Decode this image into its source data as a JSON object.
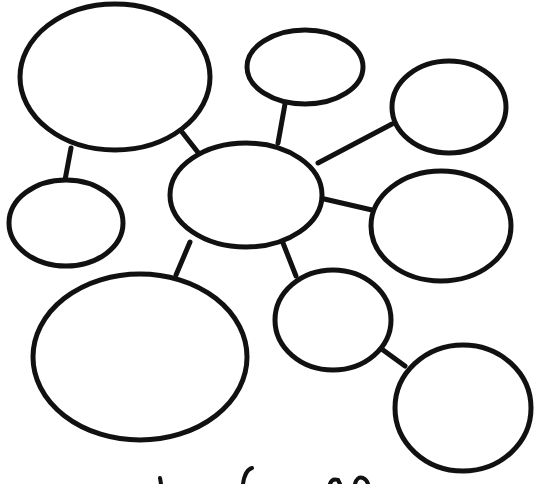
{
  "diagram": {
    "type": "bubble-map",
    "title": "",
    "colors": {
      "stroke": "#111111",
      "background": "#ffffff"
    },
    "center": {
      "id": "center",
      "label": "",
      "cx": 246,
      "cy": 195,
      "rx": 76,
      "ry": 52
    },
    "nodes": [
      {
        "id": "top-left-large",
        "label": "",
        "cx": 115,
        "cy": 77,
        "rx": 95,
        "ry": 73
      },
      {
        "id": "left-small",
        "label": "",
        "cx": 66,
        "cy": 223,
        "rx": 57,
        "ry": 43
      },
      {
        "id": "top-center",
        "label": "",
        "cx": 305,
        "cy": 67,
        "rx": 58,
        "ry": 37
      },
      {
        "id": "right-upper",
        "label": "",
        "cx": 449,
        "cy": 107,
        "rx": 57,
        "ry": 46
      },
      {
        "id": "right-middle",
        "label": "",
        "cx": 441,
        "cy": 226,
        "rx": 70,
        "ry": 55
      },
      {
        "id": "bottom-left-large",
        "label": "",
        "cx": 140,
        "cy": 357,
        "rx": 107,
        "ry": 83
      },
      {
        "id": "bottom-center",
        "label": "",
        "cx": 333,
        "cy": 320,
        "rx": 58,
        "ry": 50
      },
      {
        "id": "bottom-right",
        "label": "",
        "cx": 463,
        "cy": 408,
        "rx": 68,
        "ry": 63
      }
    ],
    "links": [
      {
        "from": "top-left-large",
        "to": "left-small",
        "x1": 71,
        "y1": 148,
        "x2": 65,
        "y2": 180
      },
      {
        "from": "top-left-large",
        "to": "center",
        "x1": 182,
        "y1": 132,
        "x2": 200,
        "y2": 155
      },
      {
        "from": "center",
        "to": "top-center",
        "x1": 278,
        "y1": 143,
        "x2": 285,
        "y2": 104
      },
      {
        "from": "center",
        "to": "right-upper",
        "x1": 318,
        "y1": 163,
        "x2": 392,
        "y2": 124
      },
      {
        "from": "center",
        "to": "right-middle",
        "x1": 320,
        "y1": 198,
        "x2": 372,
        "y2": 210
      },
      {
        "from": "center",
        "to": "bottom-left-large",
        "x1": 190,
        "y1": 242,
        "x2": 176,
        "y2": 275
      },
      {
        "from": "center",
        "to": "bottom-center",
        "x1": 283,
        "y1": 243,
        "x2": 296,
        "y2": 276
      },
      {
        "from": "bottom-center",
        "to": "bottom-right",
        "x1": 383,
        "y1": 350,
        "x2": 405,
        "y2": 366
      }
    ],
    "footer_text_visible": "partially cropped handwritten text (illegible)"
  }
}
